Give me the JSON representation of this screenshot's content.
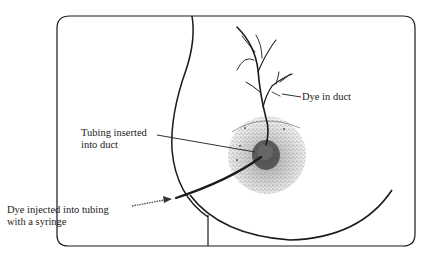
{
  "figure": {
    "labels": {
      "dye_in_duct": "Dye in duct",
      "tubing_inserted": [
        "Tubing inserted",
        "into duct"
      ],
      "dye_injected": [
        "Dye injected into tubing",
        "with a syringe"
      ]
    },
    "colors": {
      "background": "#ffffff",
      "line": "#1a1a1a",
      "areola_stipple": "#8a8a8a"
    }
  }
}
